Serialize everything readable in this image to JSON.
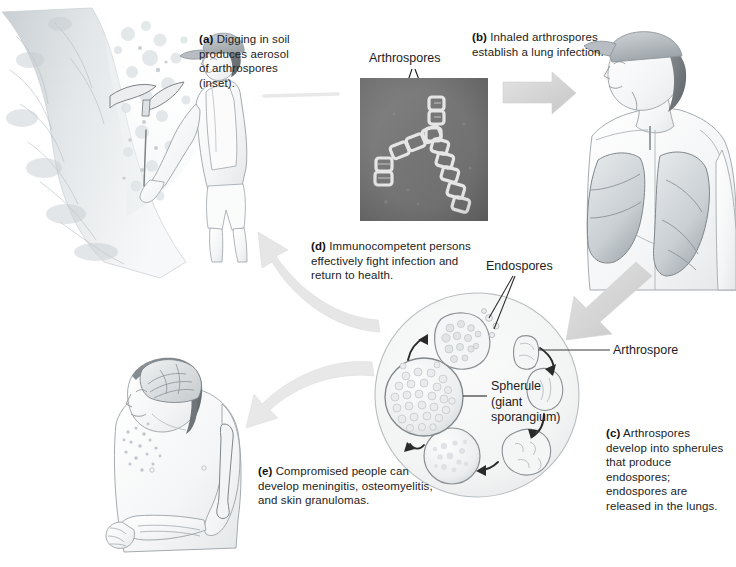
{
  "figure": {
    "width": 736,
    "height": 567,
    "background": "#ffffff"
  },
  "captions": {
    "a": {
      "tag": "(a)",
      "text": " Digging in soil produces aerosol of arthrospores (inset)."
    },
    "b": {
      "tag": "(b)",
      "text": " Inhaled arthrospores establish a lung infection."
    },
    "c": {
      "tag": "(c)",
      "text": " Arthrospores develop into spherules that produce endospores; endospores are released in the lungs."
    },
    "d": {
      "tag": "(d)",
      "text": " Immunocompetent persons effectively fight infection and return to health."
    },
    "e": {
      "tag": "(e)",
      "text": " Compromised people can develop meningitis, osteomyelitis, and skin granulomas."
    }
  },
  "labels": {
    "arthrospores_micrograph": "Arthrospores",
    "endospores": "Endospores",
    "arthrospore": "Arthrospore",
    "spherule_line1": "Spherule",
    "spherule_line2": "(giant",
    "spherule_line3": "sporangium)"
  },
  "panels": {
    "digger": {
      "name": "man-digging-soil-illustration"
    },
    "micrograph": {
      "name": "arthrospore-micrograph-inset"
    },
    "lungs": {
      "name": "man-with-lungs-illustration"
    },
    "patient": {
      "name": "compromised-patient-illustration"
    },
    "lifecycle": {
      "name": "fungal-lifecycle-circle"
    }
  },
  "colors": {
    "ink": "#222222",
    "line": "#4a4a4a",
    "arrow_gray": "#d8d8d8",
    "arrow_gray_dark": "#bdbdbd",
    "pencil": "#9aa0a4",
    "pencil_light": "#cdd2d5",
    "micrograph_bg": "#7d7d7d",
    "spore_fill": "#efefef"
  },
  "lifecycle_stages": [
    {
      "name": "arthrospore",
      "order": 1
    },
    {
      "name": "rounding-arthrospore",
      "order": 2
    },
    {
      "name": "early-spherule",
      "order": 3
    },
    {
      "name": "developing-spherule",
      "order": 4
    },
    {
      "name": "mature-spherule-giant-sporangium",
      "order": 5
    },
    {
      "name": "spherule-releasing-endospores",
      "order": 6
    }
  ]
}
